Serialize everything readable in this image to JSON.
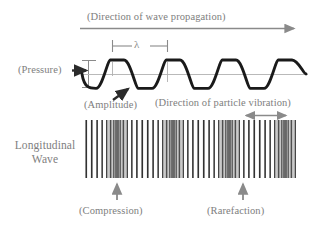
{
  "diagram": {
    "title_label": "Longitudinal\nWave",
    "labels": {
      "propagation": "(Direction of wave propagation)",
      "wavelength": "λ",
      "pressure": "(Pressure)",
      "amplitude": "(Amplitude)",
      "particle_vibration": "(Direction of particle vibration)",
      "compression": "(Compression)",
      "rarefaction": "(Rarefaction)",
      "longitudinal_wave_line1": "Longitudinal",
      "longitudinal_wave_line2": "Wave"
    },
    "colors": {
      "text": "#7e7e7e",
      "wave_stroke": "#1a1a1a",
      "axis_line": "#b9b9b9",
      "arrow_gray": "#8a8a8a",
      "stripe_dark": "#4a4a4a",
      "stripe_light": "#9a9a9a",
      "background": "#ffffff"
    },
    "icons": {
      "propagation_arrow": "long-right-arrow-icon",
      "wavelength_bracket": "wavelength-bracket-icon",
      "pressure_arrow": "right-arrow-icon",
      "amplitude_arrow": "diagonal-up-right-arrow-icon",
      "amplitude_marker": "vertical-double-arrow-icon",
      "vibration_arrow": "double-headed-horizontal-arrow-icon",
      "compression_arrow": "up-arrow-icon",
      "rarefaction_arrow": "up-arrow-icon"
    }
  },
  "chart_data": {
    "type": "line",
    "xlabel": "(Direction of wave propagation)",
    "ylabel": "(Pressure)",
    "grid": false,
    "legend": "none",
    "wave": {
      "form": "sine",
      "cycles": 4,
      "wavelength_px": 56,
      "amplitude_px": 14,
      "centerline_y_px": 74,
      "x_start_px": 82,
      "x_end_px": 306,
      "phase": "starts at zero descending"
    },
    "annotations": [
      {
        "text": "(Direction of wave propagation)",
        "x": 189,
        "y": 17,
        "kind": "axis-direction"
      },
      {
        "text": "λ",
        "x": 140,
        "y": 46,
        "kind": "wavelength-bracket",
        "span_px": [
          112,
          168
        ]
      },
      {
        "text": "(Pressure)",
        "x": 45,
        "y": 69,
        "kind": "y-axis-label"
      },
      {
        "text": "(Amplitude)",
        "x": 114,
        "y": 105,
        "kind": "amplitude-callout"
      },
      {
        "text": "(Direction of particle vibration)",
        "x": 231,
        "y": 103,
        "kind": "vibration-direction"
      },
      {
        "text": "(Compression)",
        "x": 117,
        "y": 211,
        "kind": "compression-callout"
      },
      {
        "text": "(Rarefaction)",
        "x": 243,
        "y": 211,
        "kind": "rarefaction-callout"
      }
    ],
    "stripe_band": {
      "x_start_px": 82,
      "x_end_px": 306,
      "y_top_px": 120,
      "y_bottom_px": 178,
      "compression_centers_px": [
        117,
        173,
        229,
        285
      ],
      "rarefaction_centers_px": [
        145,
        201,
        257
      ],
      "stripe_count": 96,
      "description": "vertical lines whose spacing encodes particle density; tight/dark clusters are compressions, wide/light gaps are rarefactions"
    }
  }
}
